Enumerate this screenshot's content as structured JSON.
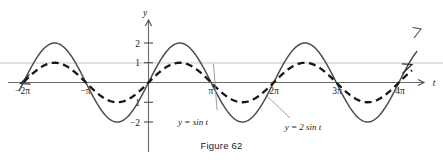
{
  "figure": {
    "caption": "Figure 62",
    "background": "#ffffff"
  },
  "chart_data": {
    "type": "line",
    "title": "",
    "xlabel": "t",
    "ylabel": "y",
    "xlim": [
      -6.8,
      13.6
    ],
    "ylim": [
      -2.6,
      2.6
    ],
    "grid": false,
    "guide_lines": [
      {
        "value": 1,
        "orientation": "horizontal",
        "color": "#e2e2e2"
      }
    ],
    "x_ticks": [
      {
        "value": -6.283185,
        "label": "−2π"
      },
      {
        "value": -3.141593,
        "label": "−π"
      },
      {
        "value": 3.141593,
        "label": "π"
      },
      {
        "value": 6.283185,
        "label": "2π"
      },
      {
        "value": 9.424778,
        "label": "3π"
      },
      {
        "value": 12.566371,
        "label": "4π"
      }
    ],
    "y_ticks": [
      {
        "value": 2,
        "label": "2"
      },
      {
        "value": 1,
        "label": "1"
      },
      {
        "value": -1,
        "label": "1"
      },
      {
        "value": -2,
        "label": "−2"
      }
    ],
    "series": [
      {
        "name": "y = sin t",
        "expression": "sin(t)",
        "amplitude": 1,
        "style": "dashed",
        "color": "#171717",
        "label": "y = sin t",
        "label_x": 3.0,
        "label_y": -2.05,
        "leader_from_x": 3.45,
        "leader_from_y": -1.72,
        "leader_to_x": 3.3,
        "leader_to_y": 0.94
      },
      {
        "name": "y = 2 sin t",
        "expression": "2 sin(t)",
        "amplitude": 2,
        "style": "solid",
        "color": "#4d4d4d",
        "label": "y = 2 sin t",
        "label_x": 7.1,
        "label_y": -2.35,
        "leader_from_x": 6.7,
        "leader_from_y": -2.02,
        "leader_to_x": 5.55,
        "leader_to_y": -0.72
      }
    ],
    "legend_position": "inline-annotations",
    "axis_color": "#6b6b6b",
    "arrow_notes": [
      "dashed curve arrow pointing down-left at t = -2π",
      "dashed curve arrow pointing up-right near t = 4π",
      "solid curve arrow pointing up-right past t = 4π",
      "t-axis arrow pointing right",
      "y-axis arrow pointing up"
    ]
  }
}
